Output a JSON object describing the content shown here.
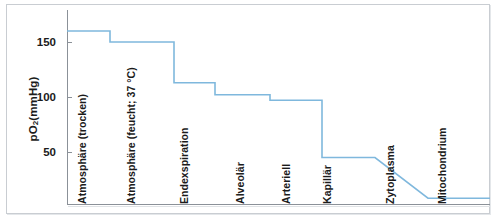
{
  "figure": {
    "y_axis_title": "pO",
    "y_axis_title_sub": "2",
    "y_axis_title_unit": " (mmHg)",
    "line_color": "#7fb8dd",
    "axis_color": "#8b9198",
    "text_color": "#1b1b1b"
  },
  "chart_data": {
    "type": "line",
    "title": "",
    "xlabel": "",
    "ylabel": "pO2 (mmHg)",
    "ylim": [
      0,
      175
    ],
    "yticks": [
      50,
      100,
      150
    ],
    "ytick_labels": [
      "50",
      "100",
      "150"
    ],
    "grid": false,
    "legend": "none",
    "step_style": "post",
    "categories": [
      "Atmosphäre (trocken)",
      "Atmosphäre (feucht; 37 °C)",
      "Endexspiration",
      "Alveolär",
      "Arteriell",
      "Kapillär",
      "Zytoplasma",
      "Mitochondrium"
    ],
    "values": [
      160,
      150,
      113,
      102,
      97,
      45,
      20,
      8
    ],
    "series": [
      {
        "name": "Sauerstoffpartialdruck-Kaskade",
        "values": [
          160,
          150,
          113,
          102,
          97,
          45,
          20,
          8
        ]
      }
    ],
    "annotations": []
  },
  "categories_display": [
    {
      "label": "Atmosphäre (trocken)",
      "x": 88
    },
    {
      "label": "Atmosphäre (feucht; 37 °C)",
      "x": 137
    },
    {
      "label": "Endexspiration",
      "x": 190
    },
    {
      "label": "Alveolär",
      "x": 246
    },
    {
      "label": "Arteriell",
      "x": 292
    },
    {
      "label": "Kapillär",
      "x": 333
    },
    {
      "label": "Zytoplasma",
      "x": 396
    },
    {
      "label": "Mitochondrium",
      "x": 448
    }
  ],
  "yticks_display": [
    {
      "label": "150",
      "y": 42
    },
    {
      "label": "100",
      "y": 97
    },
    {
      "label": "50",
      "y": 152
    }
  ]
}
